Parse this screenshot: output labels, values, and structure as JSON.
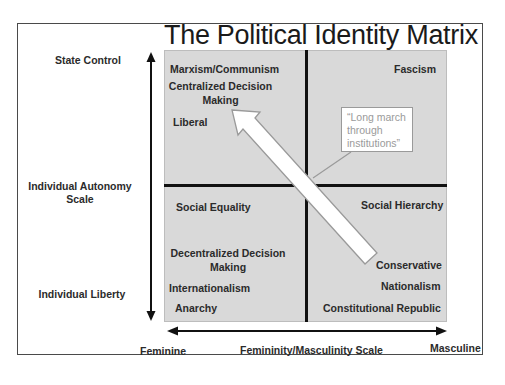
{
  "title": "The Political Identity Matrix",
  "y_axis": {
    "top_label": "State Control",
    "middle_label_line1": "Individual Autonomy",
    "middle_label_line2": "Scale",
    "bottom_label": "Individual Liberty"
  },
  "x_axis": {
    "left_label": "Feminine",
    "middle_label": "Femininity/Masculinity Scale",
    "right_label": "Masculine"
  },
  "quadrants": {
    "top_left": {
      "items": [
        "Marxism/Communism",
        "Centralized Decision",
        "Making",
        "Liberal"
      ]
    },
    "top_right": {
      "items": [
        "Fascism"
      ]
    },
    "bottom_left": {
      "items": [
        "Social Equality",
        "Decentralized Decision",
        "Making",
        "Internationalism",
        "Anarchy"
      ]
    },
    "bottom_right": {
      "items": [
        "Social Hierarchy",
        "Conservative",
        "Nationalism",
        "Constitutional Republic"
      ]
    }
  },
  "callout": {
    "line1": "“Long march",
    "line2": "through",
    "line3": "institutions”"
  },
  "colors": {
    "grid_fill": "#d9d9d9",
    "divider": "#111111",
    "arrow_fill": "#ffffff",
    "arrow_stroke": "#9a9a9a",
    "callout_text": "#9a9a9a"
  }
}
